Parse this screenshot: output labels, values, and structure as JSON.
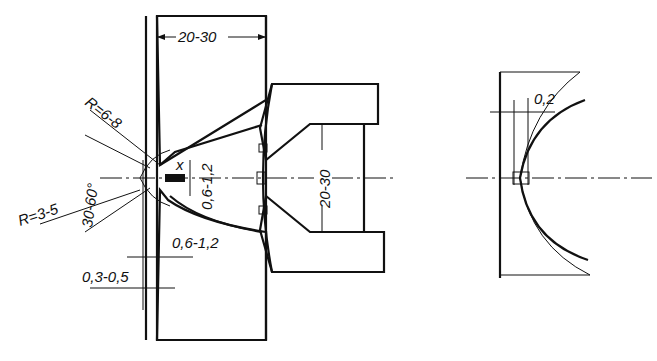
{
  "figure": {
    "left_view": {
      "dimensions": {
        "plate_thickness": "20-30",
        "radius_outer": "R=6-8",
        "radius_inner": "R=3-5",
        "angle": "30-60°",
        "gap_x": "x",
        "hole_height": "0,6-1,2",
        "land_width": "0,6-1,2",
        "foil_thickness": "0,3-0,5",
        "insert_opening": "20-30"
      }
    },
    "right_view": {
      "dimensions": {
        "offset": "0,2"
      }
    }
  }
}
